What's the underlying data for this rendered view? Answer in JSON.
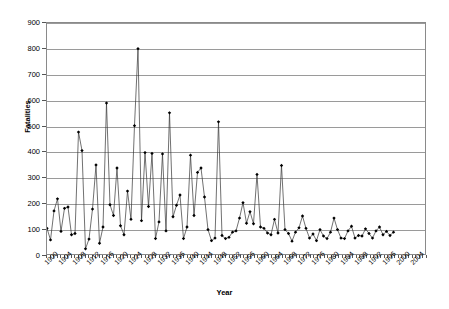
{
  "chart_data": {
    "type": "line",
    "title": "",
    "xlabel": "Year",
    "ylabel": "Fatalities",
    "ylim": [
      0,
      900
    ],
    "ytick_step": 100,
    "yticks": [
      0,
      100,
      200,
      300,
      400,
      500,
      600,
      700,
      800,
      900
    ],
    "xlim": [
      1900,
      2008
    ],
    "xtick_step": 4,
    "xticks": [
      1900,
      1904,
      1908,
      1912,
      1916,
      1920,
      1924,
      1928,
      1932,
      1936,
      1940,
      1944,
      1948,
      1952,
      1956,
      1960,
      1964,
      1968,
      1972,
      1976,
      1980,
      1984,
      1988,
      1992,
      1996,
      2000,
      2004
    ],
    "grid": "horizontal",
    "legend": "none",
    "marker": "diamond",
    "line_color": "#333333",
    "marker_color": "#000000",
    "grid_color": "#9a9a9a",
    "frame_color": "#8a8a8a",
    "x": [
      1900,
      1901,
      1902,
      1903,
      1904,
      1905,
      1906,
      1907,
      1908,
      1909,
      1910,
      1911,
      1912,
      1913,
      1914,
      1915,
      1916,
      1917,
      1918,
      1919,
      1920,
      1921,
      1922,
      1923,
      1924,
      1925,
      1926,
      1927,
      1928,
      1929,
      1930,
      1931,
      1932,
      1933,
      1934,
      1935,
      1936,
      1937,
      1938,
      1939,
      1940,
      1941,
      1942,
      1943,
      1944,
      1945,
      1946,
      1947,
      1948,
      1949,
      1950,
      1951,
      1952,
      1953,
      1954,
      1955,
      1956,
      1957,
      1958,
      1959,
      1960,
      1961,
      1962,
      1963,
      1964,
      1965,
      1966,
      1967,
      1968,
      1969,
      1970,
      1971,
      1972,
      1973,
      1974,
      1975,
      1976,
      1977,
      1978,
      1979,
      1980,
      1981,
      1982,
      1983,
      1984,
      1985,
      1986,
      1987,
      1988,
      1989,
      1990,
      1991,
      1992,
      1993,
      1994,
      1995,
      1996,
      1997,
      1998,
      1999,
      2000,
      2001,
      2002,
      2003,
      2004,
      2005,
      2006,
      2007
    ],
    "y": [
      100,
      55,
      168,
      215,
      88,
      178,
      183,
      75,
      80,
      475,
      403,
      20,
      58,
      175,
      347,
      42,
      105,
      588,
      192,
      150,
      335,
      110,
      75,
      245,
      135,
      500,
      800,
      130,
      395,
      185,
      392,
      60,
      125,
      390,
      90,
      550,
      145,
      190,
      230,
      60,
      105,
      385,
      150,
      318,
      335,
      222,
      95,
      52,
      62,
      515,
      72,
      60,
      65,
      85,
      90,
      140,
      200,
      120,
      165,
      118,
      310,
      105,
      100,
      82,
      75,
      135,
      82,
      345,
      95,
      80,
      50,
      85,
      102,
      148,
      100,
      62,
      78,
      52,
      95,
      70,
      60,
      85,
      140,
      95,
      62,
      60,
      90,
      108,
      62,
      72,
      70,
      98,
      80,
      62,
      90,
      105,
      75,
      88,
      72,
      85
    ],
    "series_name": "Fatalities"
  }
}
